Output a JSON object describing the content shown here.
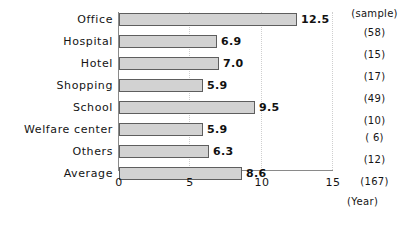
{
  "chart_data": {
    "type": "bar",
    "orientation": "horizontal",
    "title": "",
    "xlabel": "(Year)",
    "ylabel": "",
    "xlim": [
      0,
      15
    ],
    "xticks": [
      "0",
      "5",
      "10",
      "15"
    ],
    "xtick_values": [
      0,
      5,
      10,
      15
    ],
    "grid": true,
    "grid_axis": "x",
    "legend": "none",
    "categories": [
      "Office",
      "Hospital",
      "Hotel",
      "Shopping",
      "School",
      "Welfare center",
      "Others",
      "Average"
    ],
    "values": [
      12.5,
      6.9,
      7.0,
      5.9,
      9.5,
      5.9,
      6.3,
      8.6
    ],
    "value_labels": [
      "12.5",
      "6.9",
      "7.0",
      "5.9",
      "9.5",
      "5.9",
      "6.3",
      "8.6"
    ],
    "sample_header": "(sample)",
    "sample_labels": [
      "(58)",
      "(15)",
      "(17)",
      "(49)",
      "(10)",
      "( 6)",
      "(12)",
      "(167)"
    ],
    "sample_values": [
      58,
      15,
      17,
      49,
      10,
      6,
      12,
      167
    ],
    "bar_fill_color": "#d2d2d2",
    "bar_border_color": "#5e5e5e",
    "axis_color": "#8a8a8a",
    "grid_color": "#cfcfcf",
    "text_color": "#141414"
  }
}
